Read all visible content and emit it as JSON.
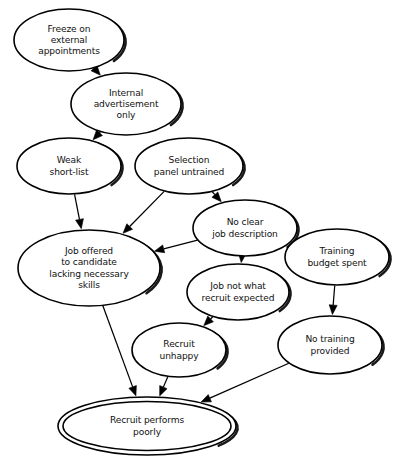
{
  "diagram": {
    "type": "directed-graph",
    "background_color": "#ffffff",
    "node_fill": "#ffffff",
    "node_stroke": "#000000",
    "edge_color": "#000000",
    "nodes": [
      {
        "id": "freeze",
        "label": "Freeze on external appointments",
        "lines": [
          "Freeze on",
          "external",
          "appointments"
        ],
        "cx": 69,
        "cy": 40,
        "rx": 55,
        "ry": 31,
        "terminal": false
      },
      {
        "id": "internal_ad",
        "label": "Internal advertisement only",
        "lines": [
          "Internal",
          "advertisement",
          "only"
        ],
        "cx": 126,
        "cy": 104,
        "rx": 55,
        "ry": 31,
        "terminal": false
      },
      {
        "id": "weak_shortlist",
        "label": "Weak short-list",
        "lines": [
          "Weak",
          "short-list"
        ],
        "cx": 69,
        "cy": 166,
        "rx": 52,
        "ry": 28,
        "terminal": false
      },
      {
        "id": "panel_untrained",
        "label": "Selection panel untrained",
        "lines": [
          "Selection",
          "panel untrained"
        ],
        "cx": 189,
        "cy": 166,
        "rx": 54,
        "ry": 28,
        "terminal": false
      },
      {
        "id": "no_job_desc",
        "label": "No clear job description",
        "lines": [
          "No clear",
          "job description"
        ],
        "cx": 245,
        "cy": 228,
        "rx": 52,
        "ry": 28,
        "terminal": false
      },
      {
        "id": "training_budget",
        "label": "Training budget spent",
        "lines": [
          "Training",
          "budget spent"
        ],
        "cx": 337,
        "cy": 257,
        "rx": 52,
        "ry": 28,
        "terminal": false
      },
      {
        "id": "job_offered",
        "label": "Job offered to candidate lacking necessary skills",
        "lines": [
          "Job offered",
          "to candidate",
          "lacking necessary",
          "skills"
        ],
        "cx": 89,
        "cy": 268,
        "rx": 71,
        "ry": 38,
        "terminal": false
      },
      {
        "id": "job_not_expected",
        "label": "Job not what recruit expected",
        "lines": [
          "Job not what",
          "recruit expected"
        ],
        "cx": 238,
        "cy": 292,
        "rx": 51,
        "ry": 28,
        "terminal": false
      },
      {
        "id": "recruit_unhappy",
        "label": "Recruit unhappy",
        "lines": [
          "Recruit",
          "unhappy"
        ],
        "cx": 179,
        "cy": 350,
        "rx": 47,
        "ry": 27,
        "terminal": false
      },
      {
        "id": "no_training",
        "label": "No training provided",
        "lines": [
          "No training",
          "provided"
        ],
        "cx": 330,
        "cy": 345,
        "rx": 52,
        "ry": 29,
        "terminal": false
      },
      {
        "id": "performs_poorly",
        "label": "Recruit performs poorly",
        "lines": [
          "Recruit performs",
          "poorly"
        ],
        "cx": 147,
        "cy": 426,
        "rx": 89,
        "ry": 29,
        "terminal": true
      }
    ],
    "edges": [
      {
        "id": "e1",
        "from": "freeze",
        "to": "internal_ad",
        "from_label": "Freeze on external appointments",
        "to_label": "Internal advertisement only"
      },
      {
        "id": "e2",
        "from": "internal_ad",
        "to": "weak_shortlist",
        "from_label": "Internal advertisement only",
        "to_label": "Weak short-list"
      },
      {
        "id": "e3",
        "from": "weak_shortlist",
        "to": "job_offered",
        "from_label": "Weak short-list",
        "to_label": "Job offered to candidate lacking necessary skills"
      },
      {
        "id": "e4",
        "from": "panel_untrained",
        "to": "job_offered",
        "from_label": "Selection panel untrained",
        "to_label": "Job offered to candidate lacking necessary skills"
      },
      {
        "id": "e5",
        "from": "panel_untrained",
        "to": "no_job_desc",
        "from_label": "Selection panel untrained",
        "to_label": "No clear job description"
      },
      {
        "id": "e6",
        "from": "no_job_desc",
        "to": "job_offered",
        "from_label": "No clear job description",
        "to_label": "Job offered to candidate lacking necessary skills"
      },
      {
        "id": "e7",
        "from": "no_job_desc",
        "to": "job_not_expected",
        "from_label": "No clear job description",
        "to_label": "Job not what recruit expected"
      },
      {
        "id": "e8",
        "from": "job_not_expected",
        "to": "recruit_unhappy",
        "from_label": "Job not what recruit expected",
        "to_label": "Recruit unhappy"
      },
      {
        "id": "e9",
        "from": "training_budget",
        "to": "no_training",
        "from_label": "Training budget spent",
        "to_label": "No training provided"
      },
      {
        "id": "e10",
        "from": "job_offered",
        "to": "performs_poorly",
        "from_label": "Job offered to candidate lacking necessary skills",
        "to_label": "Recruit performs poorly"
      },
      {
        "id": "e11",
        "from": "recruit_unhappy",
        "to": "performs_poorly",
        "from_label": "Recruit unhappy",
        "to_label": "Recruit performs poorly"
      },
      {
        "id": "e12",
        "from": "no_training",
        "to": "performs_poorly",
        "from_label": "No training provided",
        "to_label": "Recruit performs poorly"
      }
    ]
  }
}
